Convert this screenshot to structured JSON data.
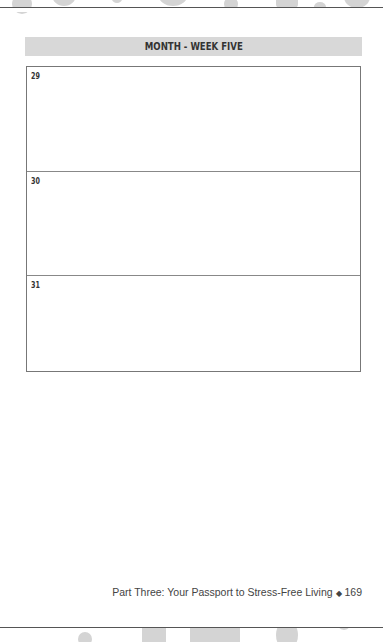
{
  "header": {
    "title": "MONTH - WEEK FIVE"
  },
  "days": [
    {
      "number": "29"
    },
    {
      "number": "30"
    },
    {
      "number": "31"
    }
  ],
  "footer": {
    "text": "Part Three: Your Passport to Stress-Free Living",
    "separator": "◆",
    "page_number": "169"
  },
  "colors": {
    "banner_bg": "#d8d8d8",
    "decoration": "#d4d4d4",
    "rule": "#555555"
  }
}
